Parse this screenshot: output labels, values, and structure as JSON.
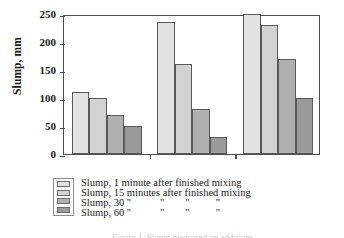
{
  "chart_data": {
    "type": "bar",
    "title": "",
    "xlabel": "",
    "ylabel": "Slump, mm",
    "ylim": [
      0,
      250
    ],
    "yticks": [
      0,
      50,
      100,
      150,
      200,
      250
    ],
    "grid": false,
    "legend_position": "bottom-left",
    "categories": [
      "Compacted",
      "Undensified\nW/b-ratio=0.27",
      "Slurry"
    ],
    "series": [
      {
        "name": "Slump, 1 minute after finished mixing",
        "values": [
          110,
          235,
          250
        ]
      },
      {
        "name": "Slump, 15 minutes after finished mixing",
        "values": [
          100,
          160,
          230
        ]
      },
      {
        "name": "Slump, 30 \"           \"        \"          \"",
        "values": [
          70,
          80,
          170
        ]
      },
      {
        "name": "Slump, 60 \"           \"        \"          \"",
        "values": [
          50,
          30,
          100
        ]
      }
    ]
  },
  "axis": {
    "y_title": "Slump, mm",
    "tick_labels": [
      "250",
      "200",
      "150",
      "100",
      "50",
      "0"
    ]
  },
  "categories": [
    {
      "label": "Compacted"
    },
    {
      "label": "Undensified\nW/b-ratio=0.27"
    },
    {
      "label": "Slurry"
    }
  ],
  "legend": {
    "rows": [
      {
        "label": "Slump, 1 minute after finished mixing"
      },
      {
        "label": "Slump, 15 minutes after finished mixing"
      },
      {
        "label": "Slump, 30 \"           \"        \"          \""
      },
      {
        "label": "Slump, 60 \"           \"        \"          \""
      }
    ]
  },
  "caption": {
    "fragment": "Figure 1.  Slump measured on additions"
  }
}
